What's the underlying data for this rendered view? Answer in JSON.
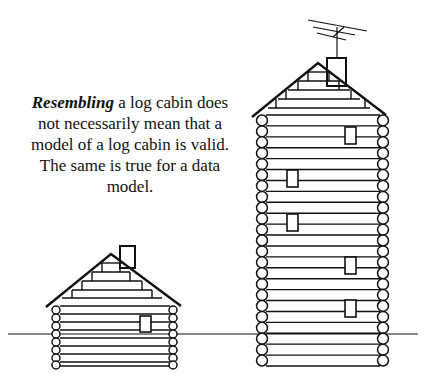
{
  "caption": {
    "emphasis": "Resembling",
    "rest": " a log cabin does not necessarily mean that a model of a log cabin is valid. The same is true for a data model."
  },
  "figures": {
    "small_cabin": {
      "label": "small-log-cabin",
      "log_rows": 8,
      "windows": 1
    },
    "tall_cabin": {
      "label": "tall-log-cabin",
      "log_rows": 23,
      "windows": 6,
      "has_antenna": true
    }
  },
  "colors": {
    "line": "#111111",
    "background": "#ffffff"
  }
}
